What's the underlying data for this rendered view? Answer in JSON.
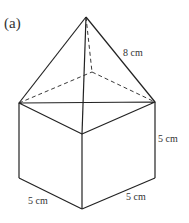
{
  "figure": {
    "label": "(a)",
    "shape": "cube with square pyramid on top",
    "dimensions": {
      "slant_edge": "8 cm",
      "height": "5 cm",
      "depth": "5 cm",
      "width": "5 cm"
    },
    "colors": {
      "line": "#222222",
      "background": "#ffffff"
    }
  }
}
